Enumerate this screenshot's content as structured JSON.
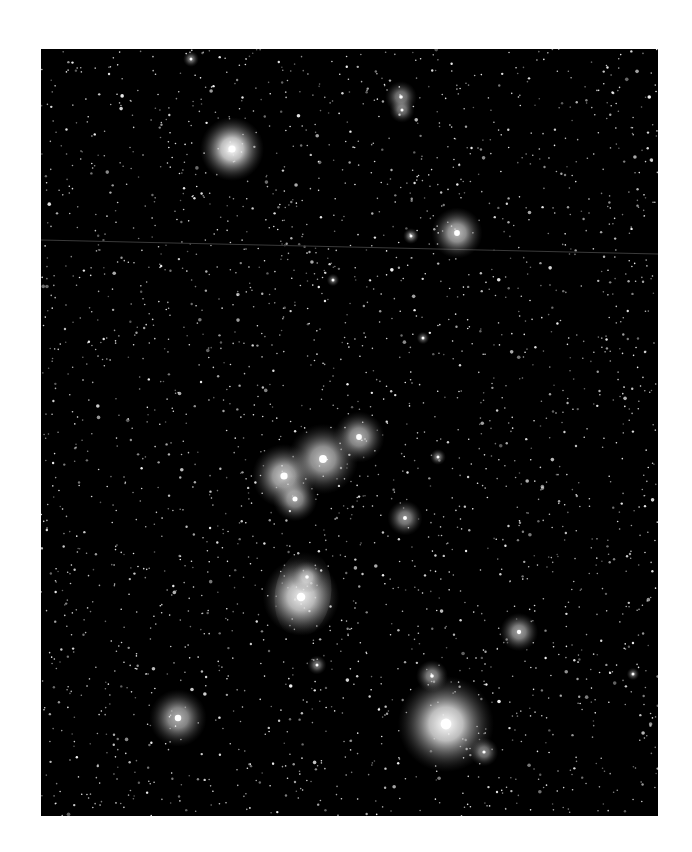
{
  "image": {
    "subject": "star-field photograph",
    "frame": {
      "x": 41,
      "y": 49,
      "width": 617,
      "height": 767
    },
    "background_color": "#000000",
    "page_color": "#ffffff",
    "star_color": "#ffffff",
    "faint_star_count": 2600,
    "streak": {
      "x1": 0,
      "y1": 191,
      "x2": 617,
      "y2": 205,
      "color": "#3a3a3a"
    },
    "bright_stars": [
      {
        "name": "star-upper-left",
        "x": 191,
        "y": 100,
        "r": 20,
        "glow": 1.0
      },
      {
        "name": "star-upper-right",
        "x": 416,
        "y": 184,
        "r": 16,
        "glow": 0.75
      },
      {
        "name": "star-small-pair-top",
        "x": 360,
        "y": 48,
        "r": 10,
        "glow": 0.55
      },
      {
        "name": "star-small-pair-top-2",
        "x": 361,
        "y": 61,
        "r": 8,
        "glow": 0.5
      },
      {
        "name": "star-near-top-right",
        "x": 370,
        "y": 187,
        "r": 5,
        "glow": 0.55
      },
      {
        "name": "belt-star-left",
        "x": 243,
        "y": 427,
        "r": 20,
        "glow": 0.8
      },
      {
        "name": "belt-star-mid",
        "x": 282,
        "y": 410,
        "r": 22,
        "glow": 0.75
      },
      {
        "name": "belt-star-right",
        "x": 318,
        "y": 388,
        "r": 16,
        "glow": 0.7
      },
      {
        "name": "belt-star-lower",
        "x": 254,
        "y": 450,
        "r": 14,
        "glow": 0.65
      },
      {
        "name": "star-mid-right",
        "x": 364,
        "y": 469,
        "r": 11,
        "glow": 0.6
      },
      {
        "name": "nebula-core",
        "x": 260,
        "y": 548,
        "r": 24,
        "glow": 0.85
      },
      {
        "name": "nebula-upper",
        "x": 266,
        "y": 528,
        "r": 10,
        "glow": 0.6
      },
      {
        "name": "star-lower-right-small",
        "x": 478,
        "y": 583,
        "r": 12,
        "glow": 0.65
      },
      {
        "name": "star-lower-mid",
        "x": 391,
        "y": 627,
        "r": 10,
        "glow": 0.6
      },
      {
        "name": "star-bright-bottom",
        "x": 405,
        "y": 675,
        "r": 30,
        "glow": 1.0
      },
      {
        "name": "star-bottom-small",
        "x": 443,
        "y": 703,
        "r": 9,
        "glow": 0.55
      },
      {
        "name": "star-lower-left",
        "x": 137,
        "y": 669,
        "r": 18,
        "glow": 0.7
      },
      {
        "name": "star-small-a",
        "x": 276,
        "y": 616,
        "r": 6,
        "glow": 0.5
      },
      {
        "name": "star-small-b",
        "x": 397,
        "y": 408,
        "r": 5,
        "glow": 0.5
      },
      {
        "name": "star-small-c",
        "x": 150,
        "y": 10,
        "r": 5,
        "glow": 0.5
      },
      {
        "name": "star-small-d",
        "x": 292,
        "y": 231,
        "r": 4,
        "glow": 0.45
      },
      {
        "name": "star-small-e",
        "x": 382,
        "y": 289,
        "r": 4,
        "glow": 0.45
      },
      {
        "name": "star-small-f",
        "x": 592,
        "y": 625,
        "r": 4,
        "glow": 0.45
      }
    ]
  }
}
